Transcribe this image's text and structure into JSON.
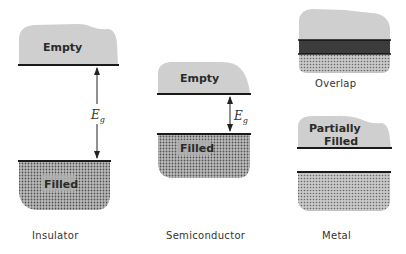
{
  "diagram": {
    "colors": {
      "empty_band": "#cfcfcf",
      "filled_band_dots": "#4a4a4a",
      "filled_band_bg": "#b8b8b8",
      "overlap_band": "#3a3a3a",
      "line": "#1a1a1a"
    },
    "panels": [
      {
        "caption": "Insulator",
        "upper_band_label": "Empty",
        "lower_band_label": "Filled",
        "gap_label": "E",
        "gap_subscript": "g"
      },
      {
        "caption": "Semiconductor",
        "upper_band_label": "Empty",
        "lower_band_label": "Filled",
        "gap_label": "E",
        "gap_subscript": "g"
      },
      {
        "caption": "Metal",
        "overlap_label": "Overlap",
        "partial_label_line1": "Partially",
        "partial_label_line2": "Filled"
      }
    ]
  }
}
